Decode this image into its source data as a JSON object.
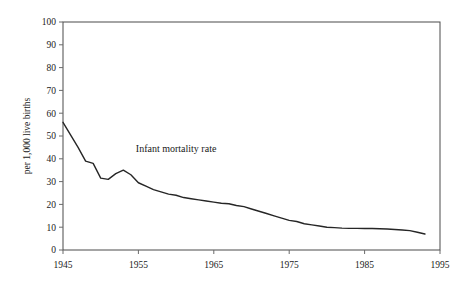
{
  "chart_data": {
    "type": "line",
    "title": "",
    "xlabel": "",
    "ylabel": "per 1,000 live births",
    "xlim": [
      1945,
      1995
    ],
    "ylim": [
      0,
      100
    ],
    "grid": false,
    "legend_position": "inline-annotation",
    "annotations": [
      {
        "text": "Infant mortality rate",
        "x": 1960,
        "y": 43
      }
    ],
    "xticks": [
      "1945",
      "1955",
      "1965",
      "1975",
      "1985",
      "1995"
    ],
    "xtick_values": [
      1945,
      1955,
      1965,
      1975,
      1985,
      1995
    ],
    "yticks": [
      "0",
      "10",
      "20",
      "30",
      "40",
      "50",
      "60",
      "70",
      "80",
      "90",
      "100"
    ],
    "ytick_values": [
      0,
      10,
      20,
      30,
      40,
      50,
      60,
      70,
      80,
      90,
      100
    ],
    "series": [
      {
        "name": "Infant mortality rate",
        "color": "#262626",
        "x": [
          1945,
          1946,
          1947,
          1948,
          1949,
          1950,
          1951,
          1952,
          1953,
          1954,
          1955,
          1956,
          1957,
          1958,
          1959,
          1960,
          1961,
          1962,
          1963,
          1964,
          1965,
          1966,
          1967,
          1968,
          1969,
          1970,
          1971,
          1972,
          1973,
          1974,
          1975,
          1976,
          1977,
          1978,
          1979,
          1980,
          1981,
          1982,
          1983,
          1984,
          1985,
          1986,
          1987,
          1988,
          1989,
          1990,
          1991,
          1992,
          1993
        ],
        "values": [
          56.0,
          50.5,
          45.0,
          39.0,
          38.0,
          31.5,
          31.0,
          33.5,
          35.0,
          33.0,
          29.5,
          28.0,
          26.5,
          25.5,
          24.5,
          24.0,
          23.0,
          22.5,
          22.0,
          21.5,
          21.0,
          20.5,
          20.3,
          19.5,
          19.0,
          18.0,
          17.0,
          16.0,
          15.0,
          14.0,
          13.0,
          12.5,
          11.5,
          11.0,
          10.5,
          10.0,
          9.8,
          9.6,
          9.5,
          9.5,
          9.4,
          9.4,
          9.3,
          9.2,
          9.0,
          8.8,
          8.5,
          7.8,
          7.0
        ]
      }
    ]
  },
  "accessibility": {
    "figure_role": "line-chart"
  }
}
